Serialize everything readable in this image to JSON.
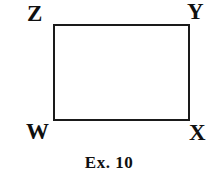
{
  "figure": {
    "shape_name": "rectangle",
    "caption": "Ex. 10",
    "stroke_color": "#1a1a1a",
    "fill_color": "#ffffff",
    "text_color": "#101010",
    "background_color": "#ffffff",
    "vertices": [
      {
        "id": "z",
        "label": "Z",
        "position": "top-left"
      },
      {
        "id": "y",
        "label": "Y",
        "position": "top-right"
      },
      {
        "id": "w",
        "label": "W",
        "position": "bottom-left"
      },
      {
        "id": "x",
        "label": "X",
        "position": "bottom-right"
      }
    ]
  }
}
